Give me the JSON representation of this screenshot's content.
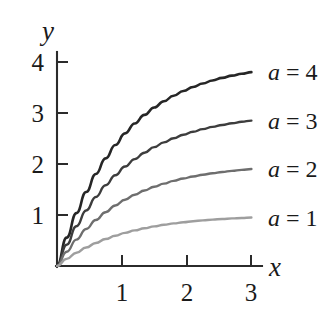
{
  "chart_data": {
    "type": "line",
    "title": "",
    "subtitle": "",
    "xlabel": "x",
    "ylabel": "y",
    "xlim": [
      0,
      3.25
    ],
    "ylim": [
      0,
      4.35
    ],
    "xticks": [
      1,
      2,
      3
    ],
    "xtick_labels": [
      "1",
      "2",
      "3"
    ],
    "yticks": [
      1,
      2,
      3,
      4
    ],
    "ytick_labels": [
      "1",
      "2",
      "3",
      "4"
    ],
    "grid": false,
    "legend_position": "right-inline-at-curve-end",
    "annotations": [
      "a = 4",
      "a = 3",
      "a = 2",
      "a = 1"
    ],
    "function_form": "y = a(1 - e^(-x))",
    "x": [
      0,
      0.15,
      0.3,
      0.45,
      0.6,
      0.75,
      0.9,
      1.05,
      1.2,
      1.35,
      1.5,
      1.65,
      1.8,
      1.95,
      2.1,
      2.25,
      2.4,
      2.55,
      2.7,
      2.85,
      3
    ],
    "series": [
      {
        "name": "a = 4",
        "a": 4,
        "color": "#262626",
        "linewidth": 2.6,
        "label_at_end": "a = 4",
        "end_value": 3.8,
        "values": [
          0,
          0.557,
          1.037,
          1.451,
          1.805,
          2.11,
          2.373,
          2.6,
          2.795,
          2.963,
          3.107,
          3.231,
          3.338,
          3.43,
          3.51,
          3.578,
          3.637,
          3.688,
          3.732,
          3.769,
          3.801
        ]
      },
      {
        "name": "a = 3",
        "a": 3,
        "color": "#3d3d3d",
        "linewidth": 2.4,
        "label_at_end": "a = 3",
        "end_value": 2.85,
        "values": [
          0,
          0.418,
          0.778,
          1.088,
          1.354,
          1.583,
          1.78,
          1.95,
          2.096,
          2.222,
          2.331,
          2.424,
          2.504,
          2.573,
          2.632,
          2.684,
          2.728,
          2.766,
          2.799,
          2.827,
          2.851
        ]
      },
      {
        "name": "a = 2",
        "a": 2,
        "color": "#6e6e6e",
        "linewidth": 2.4,
        "label_at_end": "a = 2",
        "end_value": 1.9,
        "values": [
          0,
          0.279,
          0.518,
          0.726,
          0.902,
          1.055,
          1.187,
          1.3,
          1.398,
          1.481,
          1.554,
          1.616,
          1.669,
          1.715,
          1.755,
          1.789,
          1.819,
          1.844,
          1.866,
          1.885,
          1.901
        ]
      },
      {
        "name": "a = 1",
        "a": 1,
        "color": "#9e9e9e",
        "linewidth": 2.4,
        "label_at_end": "a = 1",
        "end_value": 0.95,
        "values": [
          0,
          0.139,
          0.259,
          0.363,
          0.451,
          0.528,
          0.593,
          0.65,
          0.699,
          0.741,
          0.777,
          0.808,
          0.835,
          0.858,
          0.878,
          0.895,
          0.909,
          0.922,
          0.933,
          0.942,
          0.95
        ]
      }
    ]
  },
  "axes": {
    "y_title": "y",
    "x_title": "x"
  }
}
